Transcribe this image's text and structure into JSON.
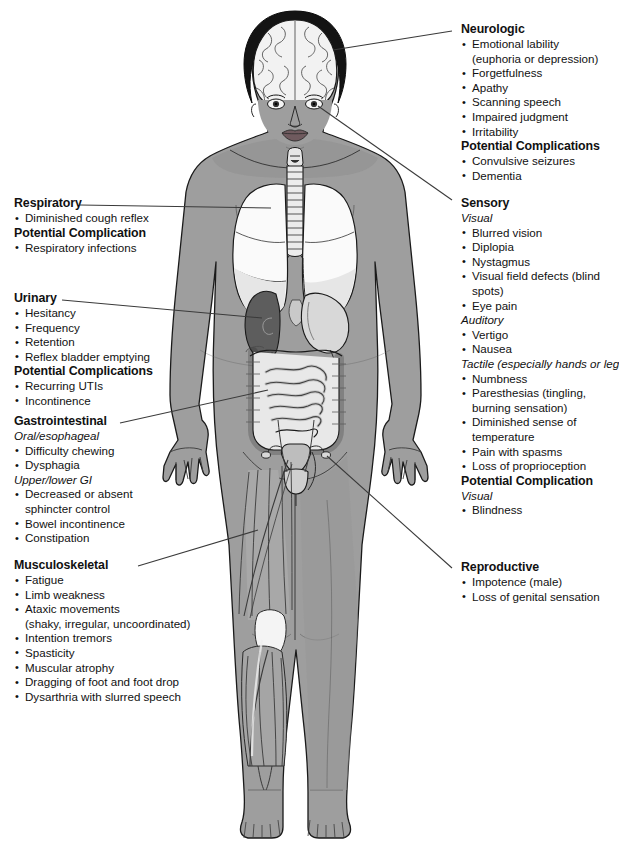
{
  "meta": {
    "figure_alt": "Anatomical illustration of a human female figure with cutaways showing brain, lungs, trachea, kidney, stomach, intestines, bladder and leg musculature"
  },
  "colors": {
    "skin": "#9e9e9e",
    "skin_shadow": "#8a8a8a",
    "hair": "#141414",
    "organ_light": "#f2f2f2",
    "organ_mid": "#d2d2d2",
    "organ_dark": "#5d5d5d",
    "outline": "#1a1a1a",
    "leader_line": "#3a3a3a",
    "text": "#111111",
    "background": "#ffffff"
  },
  "sections": [
    {
      "id": "neurologic",
      "heading": "Neurologic",
      "side": "right",
      "groups": [
        {
          "subheading": null,
          "items": [
            {
              "text": "Emotional lability",
              "cont": "(euphoria or depression)"
            },
            {
              "text": "Forgetfulness"
            },
            {
              "text": "Apathy"
            },
            {
              "text": "Scanning speech"
            },
            {
              "text": "Impaired judgment"
            },
            {
              "text": "Irritability"
            }
          ]
        }
      ],
      "complications": {
        "heading": "Potential Complications",
        "groups": [
          {
            "subheading": null,
            "items": [
              {
                "text": "Convulsive seizures"
              },
              {
                "text": "Dementia"
              }
            ]
          }
        ]
      }
    },
    {
      "id": "sensory",
      "heading": "Sensory",
      "side": "right",
      "groups": [
        {
          "subheading": "Visual",
          "items": [
            {
              "text": "Blurred vision"
            },
            {
              "text": "Diplopia"
            },
            {
              "text": "Nystagmus"
            },
            {
              "text": "Visual field defects (blind spots)"
            },
            {
              "text": "Eye pain"
            }
          ]
        },
        {
          "subheading": "Auditory",
          "items": [
            {
              "text": "Vertigo"
            },
            {
              "text": "Nausea"
            }
          ]
        },
        {
          "subheading": "Tactile (especially hands or legs)",
          "items": [
            {
              "text": "Numbness"
            },
            {
              "text": "Paresthesias (tingling,",
              "cont": "burning sensation)"
            },
            {
              "text": "Diminished sense of temperature"
            },
            {
              "text": "Pain with spasms"
            },
            {
              "text": "Loss of proprioception"
            }
          ]
        }
      ],
      "complications": {
        "heading": "Potential Complication",
        "groups": [
          {
            "subheading": "Visual",
            "items": [
              {
                "text": "Blindness"
              }
            ]
          }
        ]
      }
    },
    {
      "id": "reproductive",
      "heading": "Reproductive",
      "side": "right",
      "groups": [
        {
          "subheading": null,
          "items": [
            {
              "text": "Impotence (male)"
            },
            {
              "text": "Loss of genital sensation"
            }
          ]
        }
      ],
      "complications": null
    },
    {
      "id": "respiratory",
      "heading": "Respiratory",
      "side": "left",
      "groups": [
        {
          "subheading": null,
          "items": [
            {
              "text": "Diminished cough reflex"
            }
          ]
        }
      ],
      "complications": {
        "heading": "Potential Complication",
        "groups": [
          {
            "subheading": null,
            "items": [
              {
                "text": "Respiratory infections"
              }
            ]
          }
        ]
      }
    },
    {
      "id": "urinary",
      "heading": "Urinary",
      "side": "left",
      "groups": [
        {
          "subheading": null,
          "items": [
            {
              "text": "Hesitancy"
            },
            {
              "text": "Frequency"
            },
            {
              "text": "Retention"
            },
            {
              "text": "Reflex bladder emptying"
            }
          ]
        }
      ],
      "complications": {
        "heading": "Potential Complications",
        "groups": [
          {
            "subheading": null,
            "items": [
              {
                "text": "Recurring UTIs"
              },
              {
                "text": "Incontinence"
              }
            ]
          }
        ]
      }
    },
    {
      "id": "gastrointestinal",
      "heading": "Gastrointestinal",
      "side": "left",
      "groups": [
        {
          "subheading": "Oral/esophageal",
          "items": [
            {
              "text": "Difficulty chewing"
            },
            {
              "text": "Dysphagia"
            }
          ]
        },
        {
          "subheading": "Upper/lower GI",
          "items": [
            {
              "text": "Decreased or absent",
              "cont": "sphincter control"
            },
            {
              "text": "Bowel incontinence"
            },
            {
              "text": "Constipation"
            }
          ]
        }
      ],
      "complications": null
    },
    {
      "id": "musculoskeletal",
      "heading": "Musculoskeletal",
      "side": "left",
      "groups": [
        {
          "subheading": null,
          "items": [
            {
              "text": "Fatigue"
            },
            {
              "text": "Limb weakness"
            },
            {
              "text": "Ataxic movements",
              "cont": "(shaky, irregular, uncoordinated)"
            },
            {
              "text": "Intention tremors"
            },
            {
              "text": "Spasticity"
            },
            {
              "text": "Muscular atrophy"
            },
            {
              "text": "Dragging of foot and foot drop"
            },
            {
              "text": "Dysarthria with slurred speech"
            }
          ]
        }
      ],
      "complications": null
    }
  ],
  "anatomy_labels": [
    "brain",
    "eye",
    "larynx",
    "trachea",
    "lung-right",
    "lung-left",
    "kidney",
    "stomach",
    "large-intestine",
    "small-intestine",
    "bladder",
    "uterus",
    "thigh-musculature",
    "calf-musculature"
  ]
}
